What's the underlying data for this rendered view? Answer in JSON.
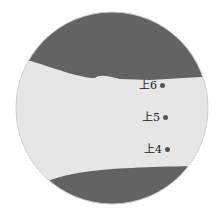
{
  "diagram": {
    "type": "acupoint-illustration",
    "colors": {
      "background": "#ffffff",
      "skin": "#e6e6e6",
      "dark": "#636363",
      "outline": "#cfcfcf",
      "dot": "#555555",
      "text": "#222222"
    },
    "points": [
      {
        "label": "上6",
        "x": 139,
        "y": 84
      },
      {
        "label": "上5",
        "x": 142,
        "y": 116
      },
      {
        "label": "上4",
        "x": 144,
        "y": 147
      }
    ]
  }
}
